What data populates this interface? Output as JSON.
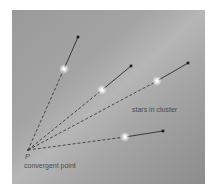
{
  "diagram": {
    "colors": {
      "background_dark": "#8e8e8e",
      "band_light": "#b4b4b4",
      "vector": "#3a3a3a",
      "star": "#ffffff",
      "label": "#4a4a4a"
    },
    "convergent_point": {
      "x": 28,
      "y": 150,
      "symbol": "P",
      "label": "convergent point"
    },
    "cluster_label": "stars in cluster",
    "stars": [
      {
        "id": 1,
        "x": 64,
        "y": 69,
        "arrow_tip": {
          "x": 78,
          "y": 37
        }
      },
      {
        "id": 2,
        "x": 102,
        "y": 90,
        "arrow_tip": {
          "x": 131,
          "y": 66
        }
      },
      {
        "id": 3,
        "x": 157,
        "y": 81,
        "arrow_tip": {
          "x": 188,
          "y": 63
        }
      },
      {
        "id": 4,
        "x": 125,
        "y": 137,
        "arrow_tip": {
          "x": 163,
          "y": 131
        }
      }
    ]
  }
}
